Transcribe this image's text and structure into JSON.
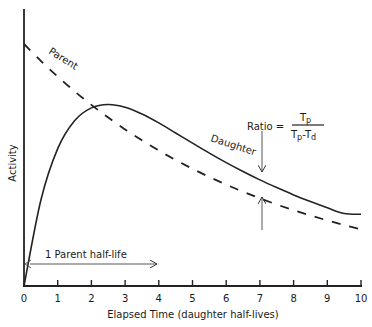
{
  "chart_data": {
    "type": "line",
    "title": "",
    "xlabel": "Elapsed Time (daughter half-lives)",
    "ylabel": "Activity",
    "xlim": [
      0,
      10
    ],
    "x_ticks": [
      "0",
      "1",
      "2",
      "3",
      "4",
      "5",
      "6",
      "7",
      "8",
      "9",
      "10"
    ],
    "y_ticks": [],
    "grid": false,
    "legend": "none (inline curve labels)",
    "x": [
      0,
      0.5,
      1,
      1.5,
      2,
      2.5,
      3,
      3.5,
      4,
      4.5,
      5,
      5.5,
      6,
      6.5,
      7,
      7.5,
      8,
      8.5,
      9,
      9.5,
      10
    ],
    "series": [
      {
        "name": "Parent",
        "style": "dashed",
        "values": [
          242,
          225.1,
          209.4,
          194.7,
          181.1,
          168.4,
          156.6,
          145.7,
          135.5,
          126.0,
          117.2,
          109.0,
          101.4,
          94.3,
          87.7,
          81.5,
          75.8,
          70.5,
          65.6,
          61.0,
          56.7
        ]
      },
      {
        "name": "Daughter",
        "style": "solid",
        "values": [
          0,
          85.8,
          137.4,
          165.3,
          178.1,
          181.5,
          178.7,
          172.0,
          163.1,
          153.0,
          142.9,
          132.9,
          123.4,
          114.5,
          106.1,
          98.4,
          91.1,
          84.4,
          78.2,
          72.5,
          71.7
        ]
      }
    ],
    "annotations": [
      {
        "text": "Parent",
        "near": "dashed curve, upper left"
      },
      {
        "text": "Daughter",
        "near": "solid curve, right of peak"
      },
      {
        "text": "Ratio = Tp / (Tp - Td)",
        "at_x": 7,
        "note": "arrows point to daughter and parent curves"
      },
      {
        "text": "1 Parent half-life",
        "arrow_from_x": 0,
        "arrow_to_x": 4
      }
    ]
  },
  "labels": {
    "parent": "Parent",
    "daughter": "Daughter",
    "ratio_prefix": "Ratio =",
    "ratio_num": "T",
    "ratio_num_sub": "p",
    "ratio_den_a": "T",
    "ratio_den_a_sub": "p",
    "ratio_den_minus": "-",
    "ratio_den_b": "T",
    "ratio_den_b_sub": "d",
    "half_life": "1 Parent half-life",
    "xlabel": "Elapsed Time (daughter half-lives)",
    "ylabel": "Activity",
    "ticks": [
      "0",
      "1",
      "2",
      "3",
      "4",
      "5",
      "6",
      "7",
      "8",
      "9",
      "10"
    ]
  }
}
